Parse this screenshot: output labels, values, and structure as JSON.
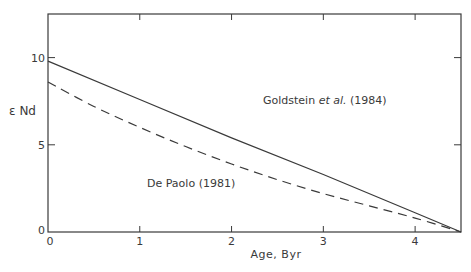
{
  "chart_data": {
    "type": "line",
    "title": "",
    "xlabel": "Age, Byr",
    "ylabel": "ε Nd",
    "xlim": [
      0,
      4.5
    ],
    "ylim": [
      0,
      12.5
    ],
    "x_ticks": [
      0,
      1,
      2,
      3,
      4
    ],
    "x_tick_labels": [
      "0",
      "1",
      "2",
      "3",
      "4"
    ],
    "y_ticks": [
      0,
      5,
      10
    ],
    "y_tick_labels": [
      "0",
      "5",
      "10"
    ],
    "grid": false,
    "legend": "inline annotations",
    "series": [
      {
        "name": "Goldstein et al. (1984)",
        "style": "solid",
        "x": [
          0,
          1,
          2,
          3,
          4,
          4.5
        ],
        "y": [
          9.8,
          7.6,
          5.4,
          3.3,
          1.1,
          0
        ]
      },
      {
        "name": "De Paolo (1981)",
        "style": "dashed",
        "x": [
          0,
          0.5,
          1,
          1.5,
          2,
          2.5,
          3,
          3.5,
          4,
          4.5
        ],
        "y": [
          8.6,
          7.2,
          6.0,
          4.9,
          3.9,
          3.0,
          2.2,
          1.5,
          0.8,
          0
        ]
      }
    ],
    "annotations": [
      {
        "text_prefix": "Goldstein ",
        "text_italic": "et al.",
        "text_suffix": " (1984)",
        "x": 2.7,
        "y": 8.6
      },
      {
        "text": "De Paolo (1981)",
        "x": 1.9,
        "y": 3.1
      }
    ]
  },
  "labels": {
    "ylabel": "ε Nd",
    "xlabel": "Age, Byr",
    "goldstein_prefix": "Goldstein ",
    "goldstein_italic": "et al.",
    "goldstein_suffix": " (1984)",
    "depaolo": "De Paolo (1981)",
    "origin_y": "0",
    "origin_x": "0"
  },
  "colors": {
    "line": "#3a3a3a",
    "background": "#ffffff"
  }
}
